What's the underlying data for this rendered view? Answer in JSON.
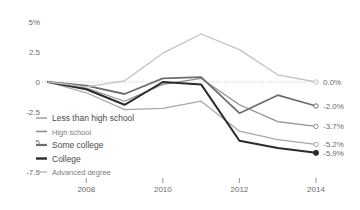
{
  "chart_data": {
    "type": "line",
    "title": "",
    "subtitle": "",
    "xlabel": "",
    "ylabel": "",
    "x": [
      2007,
      2008,
      2009,
      2010,
      2011,
      2012,
      2013,
      2014
    ],
    "xlim": [
      2007,
      2014
    ],
    "ylim": [
      -7.5,
      5
    ],
    "yticks": [
      5,
      2.5,
      0,
      -2.5,
      -5,
      -7.5
    ],
    "ytick_labels": [
      "5%",
      "2.5",
      "0",
      "-2.5",
      "5",
      "-7.5"
    ],
    "xticks": [
      2008,
      2010,
      2012,
      2014
    ],
    "xtick_labels": [
      "2008",
      "2010",
      "2012",
      "2014"
    ],
    "grid": false,
    "zero_line": true,
    "legend_position": "inside-left-bottom",
    "series": [
      {
        "name": "Less than high school",
        "color": "#a8a8a8",
        "width": 1.2,
        "end_label": "-5.2%",
        "end_marker": "open",
        "values": [
          0.0,
          -0.9,
          -2.3,
          -2.2,
          -1.6,
          -4.1,
          -4.8,
          -5.2
        ]
      },
      {
        "name": "High school",
        "color": "#8f8f8f",
        "width": 1.2,
        "end_label": "-3.7%",
        "end_marker": "open",
        "values": [
          0.0,
          -0.5,
          -1.6,
          -0.2,
          0.3,
          -1.9,
          -3.3,
          -3.7
        ]
      },
      {
        "name": "Some college",
        "color": "#6e6e6e",
        "width": 1.8,
        "end_label": "-2.0%",
        "end_marker": "open",
        "values": [
          0.0,
          -0.3,
          -1.0,
          0.3,
          0.4,
          -2.6,
          -1.1,
          -2.0
        ]
      },
      {
        "name": "College",
        "color": "#2b2b2b",
        "width": 2.0,
        "end_label": "-5.9%",
        "end_marker": "filled",
        "values": [
          0.0,
          -0.6,
          -1.9,
          0.0,
          -0.2,
          -4.9,
          -5.5,
          -5.9
        ]
      },
      {
        "name": "Advanced degree",
        "color": "#c2c2c2",
        "width": 1.3,
        "end_label": "0.0%",
        "end_marker": "open",
        "values": [
          0.0,
          -0.4,
          0.1,
          2.4,
          4.0,
          2.7,
          0.6,
          0.0
        ]
      }
    ]
  },
  "legend": {
    "items": [
      {
        "label": "Less than high school"
      },
      {
        "label": "High school"
      },
      {
        "label": "Some college"
      },
      {
        "label": "College"
      },
      {
        "label": "Advanced degree"
      }
    ]
  }
}
